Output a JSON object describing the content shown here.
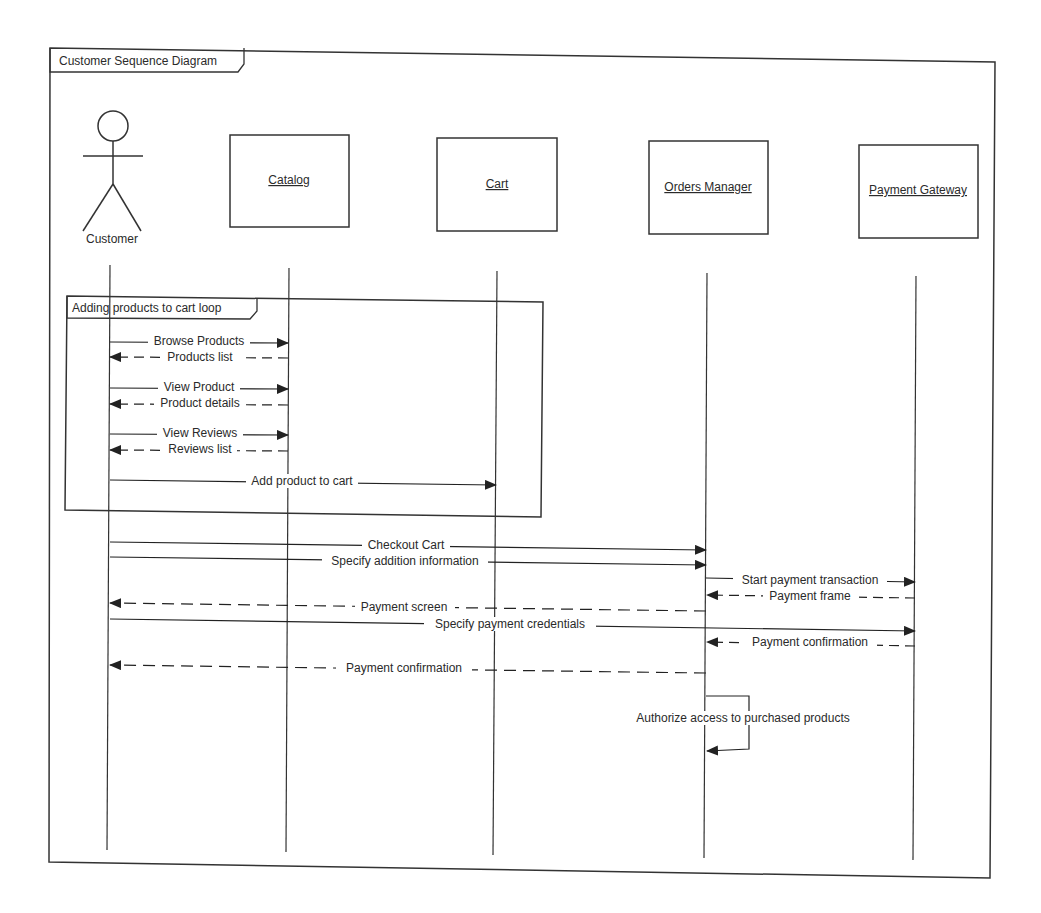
{
  "frame": {
    "title": "Customer Sequence Diagram"
  },
  "participants": [
    {
      "id": "customer",
      "label": "Customer",
      "kind": "actor",
      "x": 109
    },
    {
      "id": "catalog",
      "label": "Catalog",
      "kind": "object",
      "x": 288
    },
    {
      "id": "cart",
      "label": "Cart",
      "kind": "object",
      "x": 496
    },
    {
      "id": "orders",
      "label": "Orders Manager",
      "kind": "object",
      "x": 707
    },
    {
      "id": "gateway",
      "label": "Payment Gateway",
      "kind": "object",
      "x": 916
    }
  ],
  "loop": {
    "label": "Adding products to cart loop"
  },
  "messages": [
    {
      "label": "Browse Products",
      "from": "customer",
      "to": "catalog",
      "type": "sync",
      "y": 342
    },
    {
      "label": "Products list",
      "from": "catalog",
      "to": "customer",
      "type": "return",
      "y": 357
    },
    {
      "label": "View Product",
      "from": "customer",
      "to": "catalog",
      "type": "sync",
      "y": 388
    },
    {
      "label": "Product details",
      "from": "catalog",
      "to": "customer",
      "type": "return",
      "y": 404
    },
    {
      "label": "View Reviews",
      "from": "customer",
      "to": "catalog",
      "type": "sync",
      "y": 434
    },
    {
      "label": "Reviews list",
      "from": "catalog",
      "to": "customer",
      "type": "return",
      "y": 450
    },
    {
      "label": "Add product to cart",
      "from": "customer",
      "to": "cart",
      "type": "sync",
      "y": 483
    },
    {
      "label": "Checkout Cart",
      "from": "customer",
      "to": "orders",
      "type": "sync",
      "y": 546
    },
    {
      "label": "Specify addition information",
      "from": "customer",
      "to": "orders",
      "type": "sync",
      "y": 562
    },
    {
      "label": "Start payment transaction",
      "from": "orders",
      "to": "gateway",
      "type": "sync",
      "y": 581
    },
    {
      "label": "Payment frame",
      "from": "gateway",
      "to": "orders",
      "type": "return",
      "y": 597
    },
    {
      "label": "Payment screen",
      "from": "orders",
      "to": "customer",
      "type": "return",
      "y": 606
    },
    {
      "label": "Specify payment credentials",
      "from": "customer",
      "to": "gateway",
      "type": "sync",
      "y": 625
    },
    {
      "label": "Payment confirmation",
      "from": "gateway",
      "to": "orders",
      "type": "return",
      "y": 643
    },
    {
      "label": "Payment confirmation",
      "from": "orders",
      "to": "customer",
      "type": "return",
      "y": 668
    }
  ],
  "self_message": {
    "label": "Authorize access to purchased products",
    "on": "orders"
  }
}
